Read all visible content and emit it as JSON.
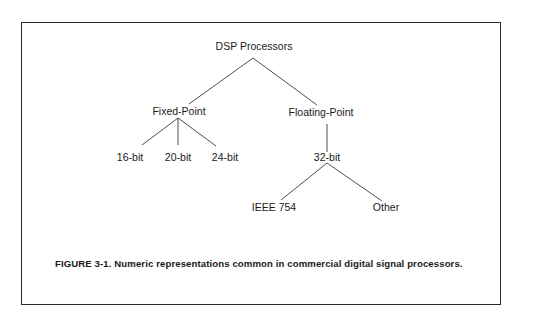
{
  "diagram": {
    "type": "tree",
    "root": {
      "label": "DSP Processors",
      "children": [
        {
          "label": "Fixed-Point",
          "children": [
            {
              "label": "16-bit"
            },
            {
              "label": "20-bit"
            },
            {
              "label": "24-bit"
            }
          ]
        },
        {
          "label": "Floating-Point",
          "children": [
            {
              "label": "32-bit",
              "children": [
                {
                  "label": "IEEE 754"
                },
                {
                  "label": "Other"
                }
              ]
            }
          ]
        }
      ]
    }
  },
  "nodes": {
    "root": "DSP Processors",
    "fixed_point": "Fixed-Point",
    "floating_point": "Floating-Point",
    "bit16": "16-bit",
    "bit20": "20-bit",
    "bit24": "24-bit",
    "bit32": "32-bit",
    "ieee754": "IEEE 754",
    "other": "Other"
  },
  "caption": {
    "text": "FIGURE 3-1. Numeric representations common in commercial digital signal processors."
  },
  "colors": {
    "line": "#3a3a3a",
    "text": "#1a1a1a",
    "frame": "#2a2a2a",
    "background": "#ffffff"
  }
}
